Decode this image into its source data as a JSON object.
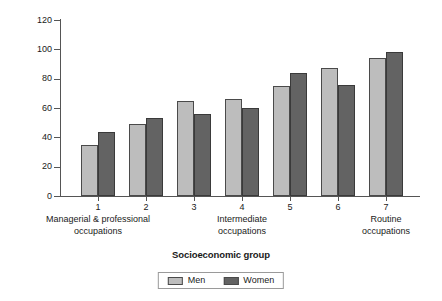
{
  "chart_data": {
    "type": "bar",
    "title": "",
    "xlabel": "Socioeconomic group",
    "ylabel": "Age-standardised rate per 1000",
    "categories": [
      "1",
      "2",
      "3",
      "4",
      "5",
      "6",
      "7"
    ],
    "series": [
      {
        "name": "Men",
        "color": "#bdbdbd",
        "values": [
          35,
          49,
          65,
          66,
          75,
          87,
          94
        ]
      },
      {
        "name": "Women",
        "color": "#636363",
        "values": [
          43.5,
          53.5,
          56,
          60,
          84,
          76,
          98
        ]
      }
    ],
    "ylim": [
      0,
      120
    ],
    "yticks": [
      "0",
      "20",
      "40",
      "60",
      "80",
      "100",
      "120"
    ],
    "grid": false,
    "legend_position": "bottom",
    "group_labels": [
      {
        "line1": "Managerial & professional",
        "line2": "occupations",
        "at_category": "1"
      },
      {
        "line1": "Intermediate",
        "line2": "occupations",
        "at_category": "4"
      },
      {
        "line1": "Routine",
        "line2": "occupations",
        "at_category": "7"
      }
    ]
  },
  "axes": {
    "y_title": "Age-standardised rate per 1000",
    "x_title": "Socioeconomic group",
    "y_tick_labels": [
      "120",
      "100",
      "80",
      "60",
      "40",
      "20",
      "0"
    ],
    "x_tick_labels": [
      "1",
      "2",
      "3",
      "4",
      "5",
      "6",
      "7"
    ]
  },
  "group_labels": {
    "left_line1": "Managerial & professional",
    "left_line2": "occupations",
    "middle_line1": "Intermediate",
    "middle_line2": "occupations",
    "right_line1": "Routine",
    "right_line2": "occupations"
  },
  "legend": {
    "men_label": "Men",
    "women_label": "Women"
  }
}
